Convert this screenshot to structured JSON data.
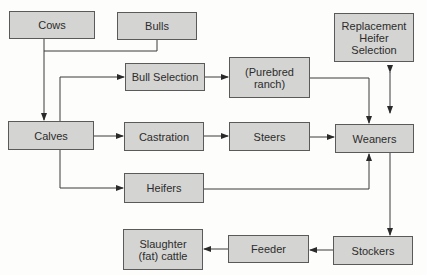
{
  "diagram": {
    "type": "flowchart",
    "nodes": {
      "cows": {
        "label": "Cows"
      },
      "bulls": {
        "label": "Bulls"
      },
      "bull_selection": {
        "label": "Bull Selection"
      },
      "purebred_ranch": {
        "label": "(Purebred\nranch)"
      },
      "replacement_heifer_selection": {
        "label": "Replacement\nHeifer\nSelection"
      },
      "calves": {
        "label": "Calves"
      },
      "castration": {
        "label": "Castration"
      },
      "steers": {
        "label": "Steers"
      },
      "weaners": {
        "label": "Weaners"
      },
      "heifers": {
        "label": "Heifers"
      },
      "slaughter_fat_cattle": {
        "label": "Slaughter\n(fat) cattle"
      },
      "feeder": {
        "label": "Feeder"
      },
      "stockers": {
        "label": "Stockers"
      }
    },
    "edges": [
      {
        "from": "cows",
        "to": "calves"
      },
      {
        "from": "bulls",
        "to": "calves"
      },
      {
        "from": "calves",
        "to": "bull_selection"
      },
      {
        "from": "calves",
        "to": "castration"
      },
      {
        "from": "calves",
        "to": "heifers"
      },
      {
        "from": "bull_selection",
        "to": "purebred_ranch"
      },
      {
        "from": "purebred_ranch",
        "to": "weaners"
      },
      {
        "from": "castration",
        "to": "steers"
      },
      {
        "from": "steers",
        "to": "weaners"
      },
      {
        "from": "heifers",
        "to": "weaners"
      },
      {
        "from": "weaners",
        "to": "replacement_heifer_selection",
        "bidirectional": true
      },
      {
        "from": "weaners",
        "to": "stockers"
      },
      {
        "from": "stockers",
        "to": "feeder"
      },
      {
        "from": "feeder",
        "to": "slaughter_fat_cattle"
      }
    ],
    "colors": {
      "node_fill": "#d4d4d2",
      "node_border": "#5a5a5a",
      "edge": "#3a3a3a",
      "text": "#2c2c2c"
    }
  }
}
